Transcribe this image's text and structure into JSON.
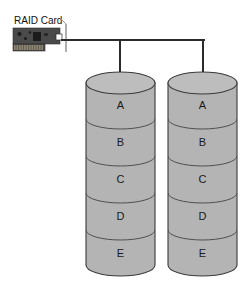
{
  "diagram": {
    "title_label": "RAID Card",
    "background_color": "#ffffff",
    "type": "raid-mirroring-diagram"
  },
  "raid_card": {
    "label": "RAID Card",
    "board_color": "#4a4a4a",
    "chip_color": "#1c1c1c",
    "connector_color": "#8c8470",
    "port_color": "#ffffff",
    "bracket_color": "#9a9a9a"
  },
  "bus": {
    "line_color": "#2b2b2b",
    "line_width": 2,
    "drop_count": 2
  },
  "disks": [
    {
      "name": "disk-left",
      "segments": [
        {
          "label": "A"
        },
        {
          "label": "B"
        },
        {
          "label": "C"
        },
        {
          "label": "D"
        },
        {
          "label": "E"
        }
      ]
    },
    {
      "name": "disk-right",
      "segments": [
        {
          "label": "A"
        },
        {
          "label": "B"
        },
        {
          "label": "C"
        },
        {
          "label": "D"
        },
        {
          "label": "E"
        }
      ]
    }
  ],
  "style": {
    "cylinder_fill": "#b4b4b4",
    "cylinder_top_fill": "#bdbdbd",
    "cylinder_stroke": "#3a3a3a",
    "divider_stroke": "#4f4f4f",
    "label_color": "#1a1a1a"
  }
}
